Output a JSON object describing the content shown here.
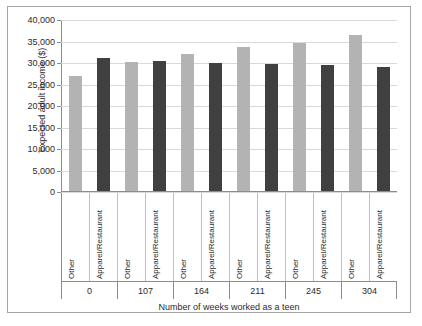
{
  "chart_data": {
    "type": "bar",
    "title": "",
    "xlabel": "Number of weeks worked as a teen",
    "ylabel": "Expected adult income ($)",
    "ylim": [
      0,
      40000
    ],
    "ytick_step": 5000,
    "ytick_labels": [
      "0",
      "5,000",
      "10,000",
      "15,000",
      "20,000",
      "25,000",
      "30,000",
      "35,000",
      "40,000"
    ],
    "ytick_values": [
      0,
      5000,
      10000,
      15000,
      20000,
      25000,
      30000,
      35000,
      40000
    ],
    "grid": true,
    "legend_position": "none",
    "categories": [
      "0",
      "107",
      "164",
      "211",
      "245",
      "304"
    ],
    "subcategories": [
      "Other",
      "Apparel/Restaurant"
    ],
    "colors": {
      "other": "#b3b3b3",
      "apparel_restaurant": "#404040",
      "gridline": "#d9d9d9",
      "axis": "#8c8c8c",
      "border": "#a6a6a6",
      "text": "#2b2b2b",
      "background": "#ffffff"
    },
    "series": [
      {
        "name": "Other",
        "values": [
          26700,
          30000,
          31800,
          33400,
          34400,
          36200
        ]
      },
      {
        "name": "Apparel/Restaurant",
        "values": [
          31000,
          30200,
          29800,
          29600,
          29300,
          28800
        ]
      }
    ],
    "bars": [
      {
        "group": "0",
        "subcategory": "Other",
        "value": 26700
      },
      {
        "group": "0",
        "subcategory": "Apparel/Restaurant",
        "value": 31000
      },
      {
        "group": "107",
        "subcategory": "Other",
        "value": 30000
      },
      {
        "group": "107",
        "subcategory": "Apparel/Restaurant",
        "value": 30200
      },
      {
        "group": "164",
        "subcategory": "Other",
        "value": 31800
      },
      {
        "group": "164",
        "subcategory": "Apparel/Restaurant",
        "value": 29800
      },
      {
        "group": "211",
        "subcategory": "Other",
        "value": 33400
      },
      {
        "group": "211",
        "subcategory": "Apparel/Restaurant",
        "value": 29600
      },
      {
        "group": "245",
        "subcategory": "Other",
        "value": 34400
      },
      {
        "group": "245",
        "subcategory": "Apparel/Restaurant",
        "value": 29300
      },
      {
        "group": "304",
        "subcategory": "Other",
        "value": 36200
      },
      {
        "group": "304",
        "subcategory": "Apparel/Restaurant",
        "value": 28800
      }
    ]
  }
}
